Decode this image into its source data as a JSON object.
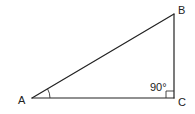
{
  "diagram": {
    "background": "#ffffff",
    "stroke_color": "#222222",
    "vertices": {
      "A": {
        "label": "A",
        "x": 32,
        "y": 98
      },
      "B": {
        "label": "B",
        "x": 174,
        "y": 14
      },
      "C": {
        "label": "C",
        "x": 174,
        "y": 98
      }
    },
    "angles": {
      "A": {
        "marker": "arc"
      },
      "C": {
        "marker": "right-angle-box",
        "label": "90°"
      }
    },
    "edges": [
      {
        "from": "A",
        "to": "B",
        "name": "hypotenuse-AB"
      },
      {
        "from": "B",
        "to": "C",
        "name": "side-BC"
      },
      {
        "from": "A",
        "to": "C",
        "name": "side-AC"
      }
    ]
  }
}
